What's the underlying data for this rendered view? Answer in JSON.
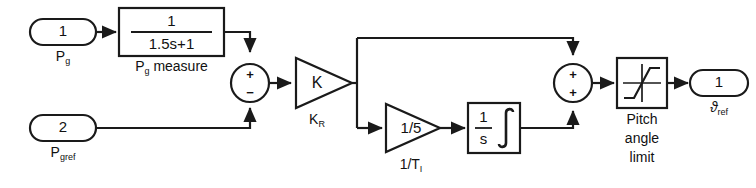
{
  "diagram": {
    "type": "control-block-diagram",
    "stroke_color": "#1a1a1a",
    "fill_color": "#ffffff",
    "background": "#ffffff"
  },
  "ports": {
    "input1": {
      "number": "1",
      "label_main": "P",
      "label_sub": "g"
    },
    "input2": {
      "number": "2",
      "label_main": "P",
      "label_sub": "gref"
    },
    "output1": {
      "number": "1",
      "label_main": "ϑ",
      "label_sub": "ref"
    }
  },
  "blocks": {
    "measure": {
      "numerator": "1",
      "denominator": "1.5s+1",
      "caption_main": "P",
      "caption_sub": "g",
      "caption_tail": " measure"
    },
    "gain_k": {
      "value": "K",
      "caption_main": "K",
      "caption_sub": "R"
    },
    "gain_ti": {
      "value": "1/5",
      "caption_main": "1/T",
      "caption_sub": "I"
    },
    "integrator": {
      "numerator": "1",
      "denominator": "s",
      "symbol": "integral-sign"
    },
    "saturation": {
      "caption_line1": "Pitch",
      "caption_line2": "angle",
      "caption_line3": "limit",
      "symbol": "saturation-curve"
    }
  },
  "sum_junctions": {
    "sum1": {
      "top_sign": "+",
      "bottom_sign": "−"
    },
    "sum2": {
      "top_sign": "+",
      "bottom_sign": "+"
    }
  }
}
